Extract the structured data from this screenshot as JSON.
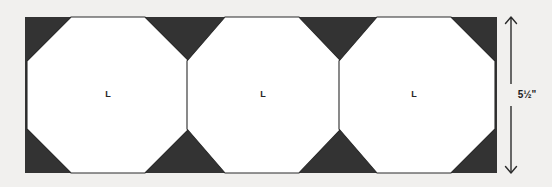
{
  "figure": {
    "background_color": "#f1f0ee",
    "panel": {
      "fill_color": "#333333",
      "x": 25,
      "y": 17,
      "width": 472,
      "height": 156
    },
    "shapes": [
      {
        "type": "octagon",
        "label": "L",
        "fill_color": "#ffffff",
        "stroke_color": "#2a2a2a",
        "center_x": 108,
        "center_y": 95,
        "width": 162,
        "height": 156,
        "corner_cut": 44,
        "label_x": 108,
        "label_y": 95
      },
      {
        "type": "octagon",
        "label": "L",
        "fill_color": "#ffffff",
        "stroke_color": "#2a2a2a",
        "center_x": 262,
        "center_y": 95,
        "width": 162,
        "height": 156,
        "corner_cut": 44,
        "label_x": 262,
        "label_y": 95
      },
      {
        "type": "octagon",
        "label": "L",
        "fill_color": "#ffffff",
        "stroke_color": "#2a2a2a",
        "center_x": 414,
        "center_y": 95,
        "width": 162,
        "height": 156,
        "corner_cut": 44,
        "label_x": 414,
        "label_y": 95
      }
    ],
    "dimension": {
      "label": "5½\"",
      "orientation": "vertical",
      "line_x": 511,
      "top_y": 17,
      "bottom_y": 173,
      "label_x": 524,
      "label_y": 95,
      "color": "#2b2b2b",
      "arrow_top": "up",
      "arrow_bottom": "down"
    }
  }
}
